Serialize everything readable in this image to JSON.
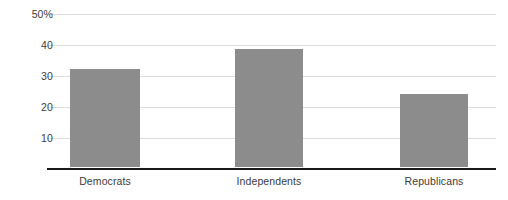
{
  "chart_data": {
    "type": "bar",
    "title": "",
    "xlabel": "",
    "ylabel": "",
    "categories": [
      "Democrats",
      "Independents",
      "Republicans"
    ],
    "values": [
      32,
      38.5,
      24
    ],
    "series": [
      {
        "name": "Percent",
        "values": [
          32,
          38.5,
          24
        ]
      }
    ],
    "ylim": [
      0,
      50
    ],
    "yticks": [
      10,
      20,
      30,
      40,
      50
    ],
    "ytick_labels": [
      "10",
      "20",
      "30",
      "40",
      "50%"
    ],
    "grid": true,
    "legend": false,
    "legend_position": "none",
    "bar_color": "#8c8c8c",
    "gridline_color": "#dcdcdc",
    "axis_color": "#1a1a1a",
    "background_color": "#ffffff",
    "tick_label_color": "#3b3b3b"
  },
  "axis": {
    "y": {
      "ticks": [
        {
          "label": "50%",
          "value": 50
        },
        {
          "label": "40",
          "value": 40
        },
        {
          "label": "30",
          "value": 30
        },
        {
          "label": "20",
          "value": 20
        },
        {
          "label": "10",
          "value": 10
        }
      ]
    },
    "x": {
      "ticks": [
        {
          "label": "Democrats"
        },
        {
          "label": "Independents"
        },
        {
          "label": "Republicans"
        }
      ]
    }
  },
  "bars": [
    {
      "label": "Democrats",
      "value": 32
    },
    {
      "label": "Independents",
      "value": 38.5
    },
    {
      "label": "Republicans",
      "value": 24
    }
  ]
}
